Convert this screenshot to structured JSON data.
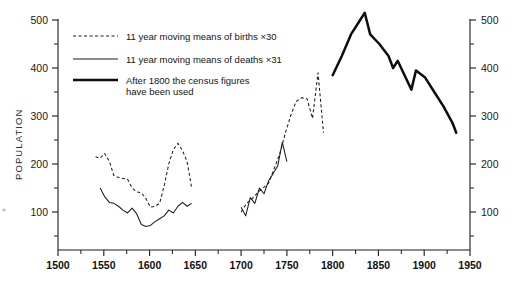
{
  "chart_data": {
    "type": "line",
    "title": "",
    "xlabel": "",
    "ylabel": "POPULATION",
    "xlim": [
      1500,
      1950
    ],
    "ylim": [
      0,
      500
    ],
    "grid": false,
    "legend_position": "top-left",
    "x_ticks": [
      1500,
      1550,
      1600,
      1650,
      1700,
      1750,
      1800,
      1850,
      1900,
      1950
    ],
    "x_tick_labels": [
      "1500",
      "1550",
      "1600",
      "1650",
      "1700",
      "1750",
      "1800",
      "1850",
      "1900",
      "1950"
    ],
    "x_minor_tick_interval": 25,
    "y_ticks": [
      100,
      200,
      300,
      400,
      500
    ],
    "y_tick_labels": [
      "100",
      "200",
      "300",
      "400",
      "500"
    ],
    "y_ticks_right": [
      100,
      200,
      300,
      400,
      500
    ],
    "y_tick_labels_right": [
      "100",
      "200",
      "300",
      "400",
      "500"
    ],
    "y_minor_tick_interval": 50,
    "series": [
      {
        "name": "11 year moving means of births ×30",
        "style": "dashed",
        "x": [
          1541,
          1546,
          1551,
          1556,
          1561,
          1566,
          1571,
          1576,
          1581,
          1586,
          1591,
          1596,
          1601,
          1606,
          1611,
          1616,
          1621,
          1626,
          1631,
          1636,
          1641,
          1646
        ],
        "values": [
          215,
          212,
          222,
          206,
          176,
          172,
          170,
          168,
          150,
          142,
          140,
          128,
          110,
          112,
          118,
          155,
          200,
          230,
          243,
          228,
          205,
          150
        ]
      },
      {
        "name": "11 year moving means of deaths ×31",
        "style": "solid-thin",
        "x": [
          1546,
          1551,
          1556,
          1561,
          1566,
          1571,
          1576,
          1581,
          1586,
          1591,
          1596,
          1601,
          1606,
          1611,
          1616,
          1621,
          1626,
          1631,
          1636,
          1641,
          1646
        ],
        "values": [
          150,
          132,
          120,
          118,
          112,
          104,
          98,
          108,
          96,
          74,
          70,
          72,
          80,
          86,
          92,
          104,
          98,
          112,
          120,
          112,
          118
        ]
      },
      {
        "name": "11 year moving means of births (1700-1790) ×30",
        "style": "dashed",
        "x": [
          1700,
          1706,
          1712,
          1718,
          1724,
          1730,
          1736,
          1742,
          1748,
          1754,
          1760,
          1766,
          1772,
          1778,
          1784,
          1790
        ],
        "values": [
          100,
          118,
          128,
          140,
          150,
          160,
          190,
          220,
          262,
          300,
          330,
          338,
          336,
          295,
          390,
          265
        ]
      },
      {
        "name": "11 year moving means of deaths (1700-1752) ×31",
        "style": "solid-thin",
        "x": [
          1700,
          1705,
          1710,
          1715,
          1720,
          1725,
          1730,
          1735,
          1740,
          1745,
          1750
        ],
        "values": [
          110,
          92,
          130,
          118,
          150,
          138,
          165,
          180,
          196,
          245,
          205
        ]
      },
      {
        "name": "After 1800 the census figures have been used",
        "style": "solid-thick",
        "x": [
          1800,
          1810,
          1820,
          1830,
          1835,
          1841,
          1851,
          1861,
          1866,
          1871,
          1881,
          1886,
          1891,
          1901,
          1911,
          1921,
          1931,
          1935
        ],
        "values": [
          385,
          425,
          470,
          500,
          515,
          470,
          450,
          425,
          400,
          415,
          375,
          355,
          395,
          380,
          350,
          320,
          285,
          265
        ]
      }
    ],
    "legend_entries": [
      {
        "label": "11 year moving means of births  ×30",
        "style": "dashed"
      },
      {
        "label": "11 year moving means of deaths ×31",
        "style": "solid-thin"
      },
      {
        "label": "After 1800 the census figures",
        "label2": "have been used",
        "style": "solid-thick"
      }
    ]
  }
}
